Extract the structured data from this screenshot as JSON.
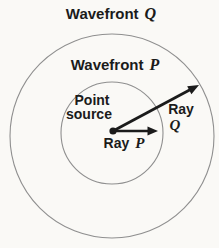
{
  "diagram": {
    "labels": {
      "wavefront_q": {
        "word": "Wavefront",
        "letter": "Q"
      },
      "wavefront_p": {
        "word": "Wavefront",
        "letter": "P"
      },
      "point_source": {
        "line1": "Point",
        "line2": "source"
      },
      "ray_p": {
        "word": "Ray",
        "letter": "P"
      },
      "ray_q": {
        "word": "Ray",
        "letter": "Q"
      }
    },
    "colors": {
      "background": "#faf9f6",
      "circle_stroke": "#8f8f8f",
      "ink": "#1b1b1b"
    }
  }
}
